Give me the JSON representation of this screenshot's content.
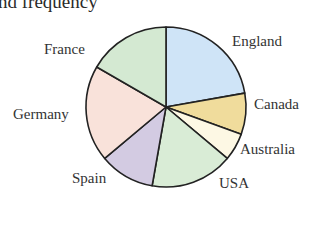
{
  "title_fragment": "nd frequency",
  "chart_data": {
    "type": "pie",
    "title": "nd frequency",
    "categories": [
      "England",
      "Canada",
      "Australia",
      "USA",
      "Spain",
      "Germany",
      "France"
    ],
    "values": [
      8,
      3,
      2,
      6,
      4,
      7,
      6
    ],
    "angles_deg": [
      80,
      30,
      20,
      60,
      40,
      70,
      60
    ],
    "colors": [
      "#cfe4f7",
      "#f0dc9c",
      "#fdf8e4",
      "#d9ecd6",
      "#d3cbe2",
      "#f9e2da",
      "#d4e9d2"
    ],
    "start_angle": "12 o'clock",
    "direction": "clockwise",
    "legend": "none (direct labels)"
  },
  "labels": {
    "england": "England",
    "canada": "Canada",
    "australia": "Australia",
    "usa": "USA",
    "spain": "Spain",
    "germany": "Germany",
    "france": "France"
  }
}
